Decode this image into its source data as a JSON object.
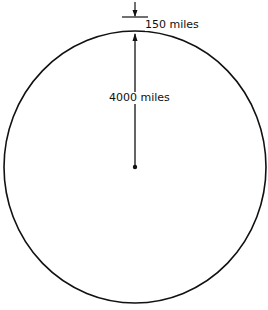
{
  "diagram": {
    "labels": {
      "atmosphere_thickness": "150 miles",
      "earth_radius": "4000 miles"
    },
    "colors": {
      "stroke": "#111111",
      "background": "#ffffff"
    }
  }
}
